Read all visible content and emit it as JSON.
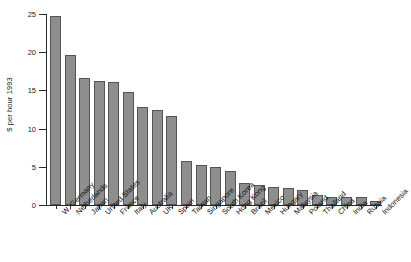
{
  "chart_data": {
    "type": "bar",
    "title": "",
    "subtitle": "",
    "xlabel": "",
    "ylabel": "$ per hour 1993",
    "ylim": [
      0,
      25
    ],
    "yticks": [
      0,
      5,
      10,
      15,
      20,
      25
    ],
    "ytick_labels": [
      "0",
      "5",
      "10",
      "15",
      "20",
      "25"
    ],
    "grid": false,
    "legend": "none",
    "orientation": "vertical",
    "bar_color": "#8e8e8e",
    "bar_edge_color": "#555555",
    "axis_color": "#2a2a2a",
    "categories": [
      "W. Germany",
      "Netherlands",
      "Japan",
      "United States",
      "France",
      "Italy",
      "Australia",
      "UK",
      "Spain",
      "Taiwan",
      "Singapore",
      "South Korea",
      "Hong Kong",
      "Brazil",
      "Mexico",
      "Hungary",
      "Malaysia",
      "Poland",
      "Thailand",
      "China",
      "India",
      "Russia",
      "Indonesia"
    ],
    "values": [
      24.7,
      19.6,
      16.6,
      16.2,
      16.1,
      14.8,
      12.8,
      12.4,
      11.7,
      5.7,
      5.3,
      5.0,
      4.4,
      2.9,
      2.6,
      2.3,
      2.2,
      1.9,
      1.3,
      1.0,
      1.0,
      1.0,
      0.5
    ]
  }
}
